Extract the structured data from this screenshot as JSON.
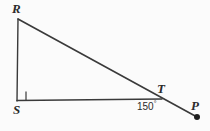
{
  "figure": {
    "kind": "geometry-diagram",
    "background_color": "#fbfbfb",
    "stroke_color": "#3a3a3a",
    "text_color": "#2b2b2b",
    "points": {
      "R": {
        "label": "R",
        "x": 18,
        "y": 19
      },
      "S": {
        "label": "S",
        "x": 17,
        "y": 101
      },
      "T": {
        "label": "T",
        "x": 161,
        "y": 98
      },
      "P": {
        "label": "P",
        "x": 197,
        "y": 117
      }
    },
    "segments": [
      {
        "name": "RS",
        "from": "R",
        "to": "S"
      },
      {
        "name": "ST",
        "from": "S",
        "to": "T"
      },
      {
        "name": "RP",
        "from": "R",
        "to": "P"
      }
    ],
    "marks": {
      "right_angle_at": "S",
      "right_angle_label": "right-angle-square"
    },
    "angles": [
      {
        "at": "T",
        "value": "150",
        "degree_symbol": "°",
        "text": "150°"
      }
    ],
    "point_dots": [
      {
        "at": "P",
        "radius": 3
      }
    ]
  }
}
